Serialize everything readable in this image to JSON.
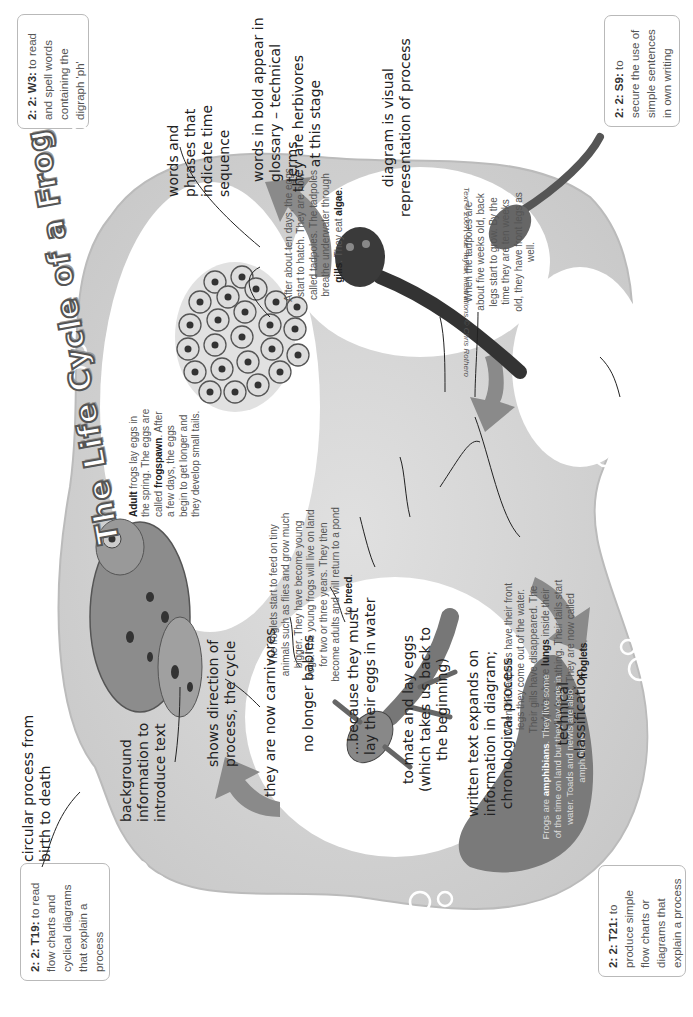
{
  "objective_boxes": {
    "w3": {
      "code": "2: 2: W3:",
      "text": " to read and spell words containing the digraph 'ph'"
    },
    "s9": {
      "code": "2: 2: S9:",
      "text": " to secure the use of simple sentences in own writing"
    },
    "t19": {
      "code": "2: 2: T19:",
      "text": " to read flow charts and cyclical diagrams that explain a process"
    },
    "t21": {
      "code": "2: 2: T21:",
      "text": " to produce simple flow charts or diagrams that explain a process"
    }
  },
  "title": "The Life Cycle of a Frog",
  "copyright": "Text © 2007, Sue Taylor; Illustrations © Chris Rothero",
  "stages": {
    "adult": {
      "bold1": "Adult",
      "text": " frogs lay eggs in the spring. The eggs are called ",
      "bold2": "frogspawn",
      "text2": ". After a few days, the eggs begin to get longer and they develop small tails."
    },
    "tadpole": {
      "text": "After about ten days, the eggs start to hatch. They are now called tadpoles. The tadpoles breathe underwater through ",
      "bold1": "gills",
      "text2": ". They eat ",
      "bold2": "algae",
      "text3": "."
    },
    "legs": {
      "text": "When the tadpoles are about five weeks old, back legs start to grow. By the time they are ten weeks old, they have front legs as well."
    },
    "froglet": {
      "text": "When the tadpoles have their front legs they come out of the water. Their gills have disappeared. The tadpoles have ",
      "bold1": "lungs",
      "text2": " inside their bodies for breathing. Their tails start to shrink. They are now called ",
      "bold2": "froglets",
      "text3": "."
    },
    "young_frog": {
      "text": "The froglets start to feed on tiny animals such as flies and grow much bigger. They have become young frogs. The young frogs will live on land for two or three years. They then become adults and will return to a pond to ",
      "bold1": "breed",
      "text2": "."
    },
    "amphibian": {
      "text1": "Frogs are ",
      "bold1": "amphibians",
      "text2": ". They live some of the time on land but they lay eggs in water. Toads and newts are also amphibians."
    }
  },
  "annotations": {
    "circular": "circular process from\nbirth to death",
    "background": "background\ninformation to\nintroduce text",
    "direction": "shows direction of\nprocess, the cycle",
    "carnivores": "they are now carnivores",
    "no_babies": "no longer babies",
    "because": "...because they must\nlay their eggs in water",
    "mate": "to mate and lay eggs\n(which takes us back to\nthe beginning)",
    "written": "written text expands on\ninformation in diagram;\nchronological process",
    "technical": "technical\nclassification",
    "time_words": "words and\nphrases that\nindicate time\nsequence",
    "bold_words": "words in bold appear in\nglossary – technical terms",
    "herbivores": "they are herbivores\nat this stage",
    "diagram": "diagram is visual\nrepresentation of process"
  },
  "colors": {
    "background_blob": "#d4d4d4",
    "bubble_circle": "#ffffff",
    "arrow": "#8a8a8a",
    "amphibian_blob": "#7a7a7a",
    "box_border": "#b9b9b9"
  }
}
